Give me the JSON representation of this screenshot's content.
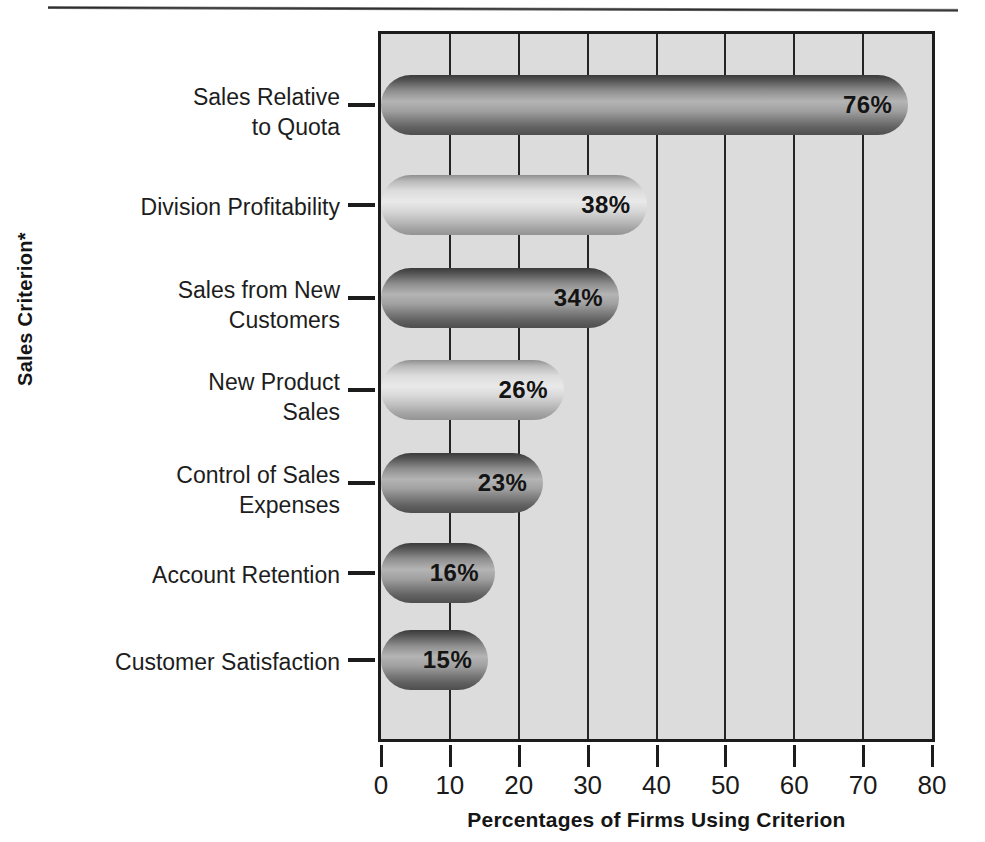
{
  "chart_data": {
    "type": "bar",
    "orientation": "horizontal",
    "title": "",
    "xlabel": "Percentages of Firms Using Criterion",
    "ylabel": "Sales Criterion*",
    "categories": [
      "Sales Relative\nto Quota",
      "Division Profitability",
      "Sales from New\nCustomers",
      "New Product\nSales",
      "Control of Sales\nExpenses",
      "Account Retention",
      "Customer Satisfaction"
    ],
    "values": [
      76,
      38,
      34,
      26,
      23,
      16,
      15
    ],
    "value_labels": [
      "76%",
      "38%",
      "34%",
      "26%",
      "23%",
      "16%",
      "15%"
    ],
    "bar_styles": [
      "dark",
      "light",
      "dark",
      "light",
      "dark",
      "dark",
      "dark"
    ],
    "xlim": [
      0,
      80
    ],
    "xticks": [
      0,
      10,
      20,
      30,
      40,
      50,
      60,
      70,
      80
    ],
    "xticklabels": [
      "0",
      "10",
      "20",
      "30",
      "40",
      "50",
      "60",
      "70",
      "80"
    ],
    "grid": "vertical",
    "legend": "none",
    "plot_background": "#dcdcdc",
    "frame_color": "#1c1c1c",
    "gridline_color": "#242424"
  }
}
